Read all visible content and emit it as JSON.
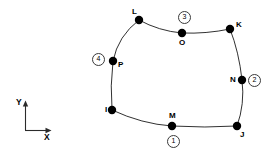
{
  "figure": {
    "type": "node-element-diagram",
    "background_color": "#ffffff",
    "line_color": "#1a1a1a",
    "node_color": "#000000",
    "width": 277,
    "height": 152
  },
  "axes": {
    "x_label": "X",
    "y_label": "Y",
    "origin": {
      "x": 25,
      "y": 130
    },
    "x_tip": {
      "x": 51,
      "y": 130
    },
    "y_tip": {
      "x": 25,
      "y": 101
    }
  },
  "nodes": [
    {
      "id": "I",
      "label": "I",
      "x": 112,
      "y": 110,
      "label_dx": -7,
      "label_dy": -4,
      "radius": 4.2
    },
    {
      "id": "J",
      "label": "J",
      "x": 237,
      "y": 126,
      "label_dx": 3,
      "label_dy": 5,
      "radius": 4.2
    },
    {
      "id": "K",
      "label": "K",
      "x": 230,
      "y": 29,
      "label_dx": 6,
      "label_dy": -8,
      "radius": 4.2
    },
    {
      "id": "L",
      "label": "L",
      "x": 139,
      "y": 20,
      "label_dx": -7,
      "label_dy": -12,
      "radius": 4.2
    },
    {
      "id": "M",
      "label": "M",
      "x": 172,
      "y": 126,
      "label_dx": -3,
      "label_dy": -14,
      "radius": 4.2
    },
    {
      "id": "N",
      "label": "N",
      "x": 242,
      "y": 80,
      "label_dx": -12,
      "label_dy": -4,
      "radius": 4.2
    },
    {
      "id": "O",
      "label": "O",
      "x": 182,
      "y": 33,
      "label_dx": -3,
      "label_dy": 6,
      "radius": 4.2
    },
    {
      "id": "P",
      "label": "P",
      "x": 113,
      "y": 61,
      "label_dx": 5,
      "label_dy": 0,
      "radius": 4.2
    }
  ],
  "edges": [
    {
      "id": "edge-1",
      "name": "side-1-bottom",
      "from": "I",
      "to": "J",
      "mid": "M",
      "path": "M 112 110 Q 142 124 172 126 Q 205 128 237 126"
    },
    {
      "id": "edge-2",
      "name": "side-2-right",
      "from": "J",
      "to": "K",
      "mid": "N",
      "path": "M 237 126 Q 245 104 242 80 Q 239 52 230 29"
    },
    {
      "id": "edge-3",
      "name": "side-3-top",
      "from": "K",
      "to": "L",
      "mid": "O",
      "path": "M 230 29 Q 206 34 182 33 Q 159 31 139 20"
    },
    {
      "id": "edge-4",
      "name": "side-4-left",
      "from": "L",
      "to": "I",
      "mid": "P",
      "path": "M 139 20 Q 118 36 113 61 Q 110 86 112 110"
    }
  ],
  "side_badges": [
    {
      "id": "badge-1",
      "label": "1",
      "side": "edge-1",
      "x": 167,
      "y": 135
    },
    {
      "id": "badge-2",
      "label": "2",
      "side": "edge-2",
      "x": 248,
      "y": 74
    },
    {
      "id": "badge-3",
      "label": "3",
      "side": "edge-3",
      "x": 178,
      "y": 11
    },
    {
      "id": "badge-4",
      "label": "4",
      "side": "edge-4",
      "x": 92,
      "y": 53
    }
  ]
}
